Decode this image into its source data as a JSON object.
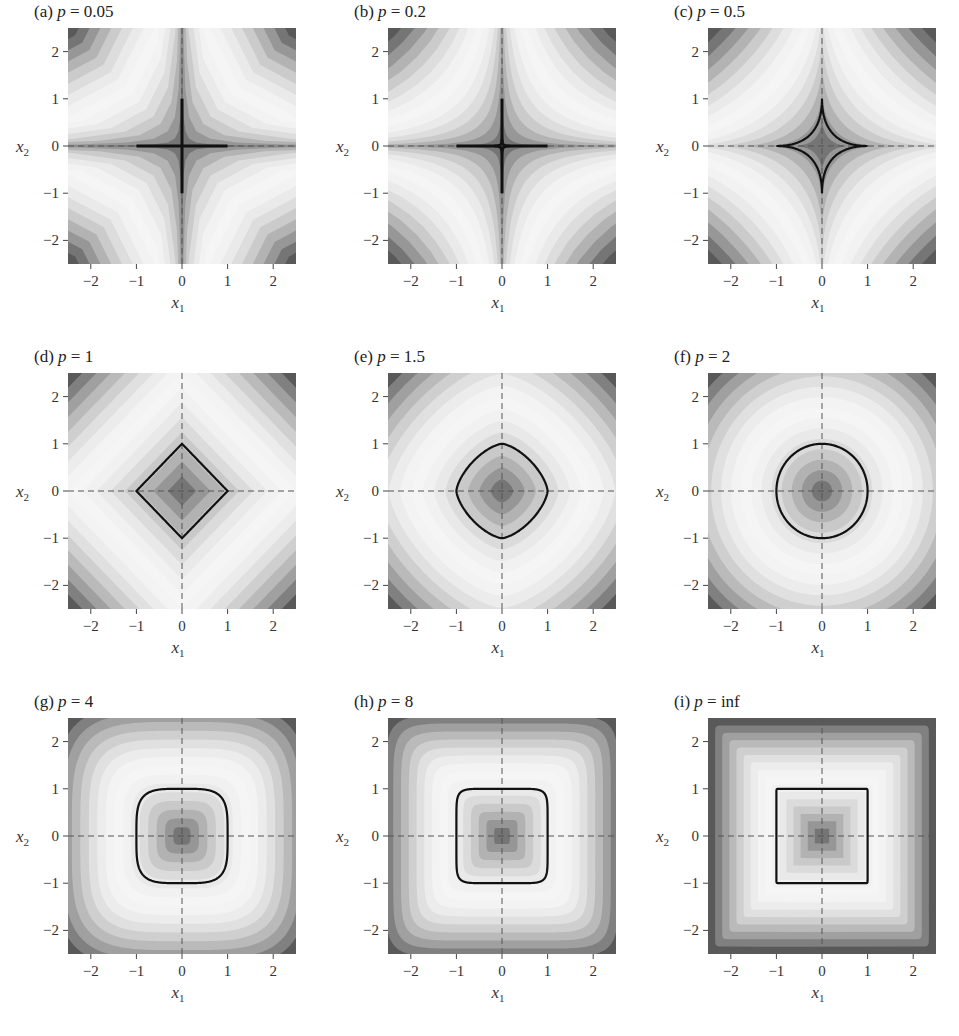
{
  "chart_data": {
    "type": "heatmap",
    "xlabel": "x1",
    "ylabel": "x2",
    "xlim": [
      -2.5,
      2.5
    ],
    "ylim": [
      -2.5,
      2.5
    ],
    "xticks": [
      -2,
      -1,
      0,
      1,
      2
    ],
    "yticks": [
      -2,
      -1,
      0,
      1,
      2
    ],
    "colormap": "grayscale, dark at low and high values, light in between",
    "unit_contour": "black solid line at ||x||_p = 1",
    "axes_lines": "dashed lines at x1=0 and x2=0",
    "panels": [
      {
        "label": "(a)",
        "p": "0.05",
        "pval": 0.05
      },
      {
        "label": "(b)",
        "p": "0.2",
        "pval": 0.2
      },
      {
        "label": "(c)",
        "p": "0.5",
        "pval": 0.5
      },
      {
        "label": "(d)",
        "p": "1",
        "pval": 1
      },
      {
        "label": "(e)",
        "p": "1.5",
        "pval": 1.5
      },
      {
        "label": "(f)",
        "p": "2",
        "pval": 2
      },
      {
        "label": "(g)",
        "p": "4",
        "pval": 4
      },
      {
        "label": "(h)",
        "p": "8",
        "pval": 8
      },
      {
        "label": "(i)",
        "p": "inf",
        "pval": 1000
      }
    ]
  },
  "labels": {
    "p_symbol": "p",
    "equals": " = ",
    "x1": "x",
    "x1_sub": "1",
    "x2": "x",
    "x2_sub": "2"
  }
}
